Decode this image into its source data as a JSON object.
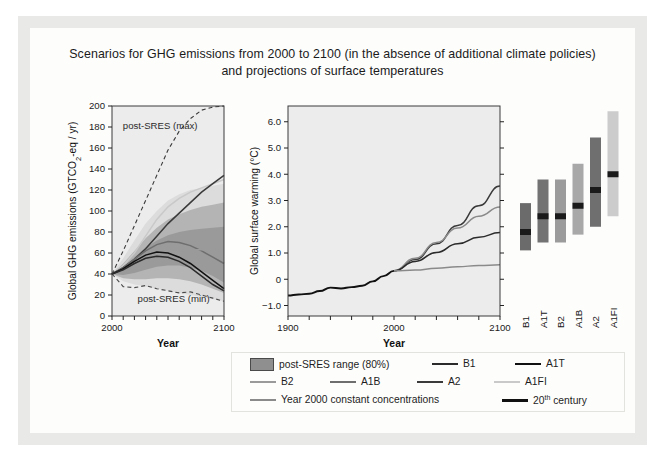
{
  "figure": {
    "title_line1": "Scenarios for GHG emissions from 2000 to 2100 (in the absence of additional climate policies)",
    "title_line2": "and projections of surface temperatures"
  },
  "legend": {
    "range_label": "post-SRES range (80%)",
    "items": [
      {
        "name": "B1",
        "color": "#2b2b2b"
      },
      {
        "name": "A1T",
        "color": "#111111"
      },
      {
        "name": "B2",
        "color": "#9a9a9a"
      },
      {
        "name": "A1B",
        "color": "#6e6e6e"
      },
      {
        "name": "A2",
        "color": "#3a3a3a"
      },
      {
        "name": "A1FI",
        "color": "#c9c9c9"
      },
      {
        "name": "Year 2000 constant concentrations",
        "color": "#8a8a8a"
      }
    ],
    "century_label_main": "20",
    "century_label_sup": "th",
    "century_label_tail": " century",
    "century_color": "#111111"
  },
  "chart_data": [
    {
      "type": "line",
      "id": "ghg-emissions",
      "title": "",
      "xlabel": "Year",
      "ylabel": "Global GHG emissions (GTCO2-eq / yr)",
      "ylabel_main": "Global GHG emissions (GTCO",
      "ylabel_sub": "2",
      "ylabel_tail": "-eq / yr)",
      "xlim": [
        2000,
        2100
      ],
      "ylim": [
        0,
        200
      ],
      "yticks": [
        0,
        20,
        40,
        60,
        80,
        100,
        120,
        140,
        160,
        180,
        200
      ],
      "xticks": [
        2000,
        2100
      ],
      "xminor_step": 10,
      "grid": false,
      "annotations": [
        {
          "text": "post-SRES (max)",
          "x": 2018,
          "y": 178
        },
        {
          "text": "post-SRES (min)",
          "x": 2030,
          "y": 13
        }
      ],
      "x": [
        2000,
        2010,
        2020,
        2030,
        2040,
        2050,
        2060,
        2070,
        2080,
        2090,
        2100
      ],
      "bands": [
        {
          "name": "post-SRES range outer",
          "shade": "#dcdcdc",
          "upper": [
            40,
            55,
            72,
            88,
            100,
            110,
            116,
            120,
            122,
            124,
            126
          ],
          "lower": [
            40,
            33,
            30,
            28,
            26,
            24,
            22,
            20,
            18,
            16,
            14
          ]
        },
        {
          "name": "post-SRES range 80%",
          "shade": "#b4b4b4",
          "upper": [
            40,
            50,
            62,
            74,
            84,
            92,
            97,
            101,
            104,
            106,
            108
          ],
          "lower": [
            40,
            36,
            35,
            35,
            36,
            36,
            35,
            33,
            30,
            26,
            22
          ]
        },
        {
          "name": "inner range",
          "shade": "#9a9a9a",
          "upper": [
            40,
            47,
            56,
            65,
            72,
            77,
            80,
            82,
            83,
            84,
            85
          ],
          "lower": [
            40,
            39,
            41,
            44,
            47,
            48,
            48,
            46,
            43,
            38,
            32
          ]
        }
      ],
      "series": [
        {
          "name": "post-SRES (max)",
          "style": "dashed",
          "color": "#3a3a3a",
          "values": [
            40,
            62,
            86,
            110,
            134,
            158,
            176,
            188,
            196,
            199,
            200
          ]
        },
        {
          "name": "post-SRES (min)",
          "style": "dashed",
          "color": "#4a4a4a",
          "values": [
            40,
            28,
            27,
            29,
            26,
            24,
            22,
            23,
            20,
            17,
            14
          ]
        },
        {
          "name": "A1FI",
          "color": "#c9c9c9",
          "values": [
            40,
            48,
            60,
            76,
            92,
            104,
            112,
            118,
            122,
            126,
            130
          ]
        },
        {
          "name": "A2",
          "color": "#3a3a3a",
          "values": [
            40,
            46,
            54,
            64,
            76,
            88,
            98,
            108,
            118,
            126,
            134
          ]
        },
        {
          "name": "A1B",
          "color": "#6e6e6e",
          "values": [
            40,
            46,
            54,
            62,
            68,
            71,
            70,
            67,
            62,
            56,
            50
          ]
        },
        {
          "name": "B2",
          "color": "#9a9a9a",
          "values": [
            40,
            44,
            49,
            54,
            58,
            61,
            62,
            63,
            63,
            63,
            62
          ]
        },
        {
          "name": "A1T",
          "color": "#111111",
          "values": [
            40,
            45,
            52,
            58,
            61,
            60,
            56,
            50,
            42,
            34,
            26
          ]
        },
        {
          "name": "B1",
          "color": "#2b2b2b",
          "values": [
            40,
            44,
            50,
            55,
            57,
            56,
            52,
            46,
            38,
            30,
            24
          ]
        }
      ]
    },
    {
      "type": "line",
      "id": "surface-warming",
      "title": "",
      "xlabel": "Year",
      "ylabel": "Global surface warming (°C)",
      "xlim": [
        1900,
        2100
      ],
      "ylim": [
        -1.4,
        6.6
      ],
      "yticks": [
        -1.0,
        0,
        1.0,
        2.0,
        3.0,
        4.0,
        5.0,
        6.0
      ],
      "ytick_labels": [
        "−1.0",
        "0",
        "1.0",
        "2.0",
        "3.0",
        "4.0",
        "5.0",
        "6.0"
      ],
      "xticks": [
        1900,
        2000,
        2100
      ],
      "grid": false,
      "series": [
        {
          "name": "20th century",
          "color": "#111111",
          "x": [
            1900,
            1910,
            1920,
            1930,
            1940,
            1950,
            1960,
            1970,
            1980,
            1990,
            2000
          ],
          "values": [
            -0.62,
            -0.58,
            -0.55,
            -0.45,
            -0.32,
            -0.35,
            -0.3,
            -0.25,
            -0.08,
            0.12,
            0.32
          ]
        },
        {
          "name": "A2",
          "color": "#3a3a3a",
          "x": [
            2000,
            2020,
            2040,
            2060,
            2080,
            2100
          ],
          "values": [
            0.32,
            0.75,
            1.35,
            2.05,
            2.8,
            3.55
          ]
        },
        {
          "name": "A1B",
          "color": "#8a8a8a",
          "x": [
            2000,
            2020,
            2040,
            2060,
            2080,
            2100
          ],
          "values": [
            0.32,
            0.8,
            1.4,
            1.95,
            2.4,
            2.75
          ]
        },
        {
          "name": "B1",
          "color": "#2b2b2b",
          "x": [
            2000,
            2020,
            2040,
            2060,
            2080,
            2100
          ],
          "values": [
            0.32,
            0.68,
            1.02,
            1.35,
            1.6,
            1.78
          ]
        },
        {
          "name": "Year 2000 constant concentrations",
          "color": "#8a8a8a",
          "x": [
            2000,
            2020,
            2040,
            2060,
            2080,
            2100
          ],
          "values": [
            0.32,
            0.35,
            0.42,
            0.48,
            0.52,
            0.55
          ]
        }
      ]
    },
    {
      "type": "bar",
      "id": "scenario-ranges",
      "title": "",
      "ylabel": "Global surface warming (°C)",
      "ylim": [
        -1.4,
        6.6
      ],
      "categories": [
        "B1",
        "A1T",
        "B2",
        "A1B",
        "A2",
        "A1FI"
      ],
      "bars": [
        {
          "label": "B1",
          "low": 1.1,
          "high": 2.9,
          "best": 1.8,
          "color": "#6b6b6b"
        },
        {
          "label": "A1T",
          "low": 1.4,
          "high": 3.8,
          "best": 2.4,
          "color": "#737373"
        },
        {
          "label": "B2",
          "low": 1.4,
          "high": 3.8,
          "best": 2.4,
          "color": "#9b9b9b"
        },
        {
          "label": "A1B",
          "low": 1.7,
          "high": 4.4,
          "best": 2.8,
          "color": "#a8a8a8"
        },
        {
          "label": "A2",
          "low": 2.0,
          "high": 5.4,
          "best": 3.4,
          "color": "#6f6f6f"
        },
        {
          "label": "A1FI",
          "low": 2.4,
          "high": 6.4,
          "best": 4.0,
          "color": "#cccccc"
        }
      ]
    }
  ]
}
